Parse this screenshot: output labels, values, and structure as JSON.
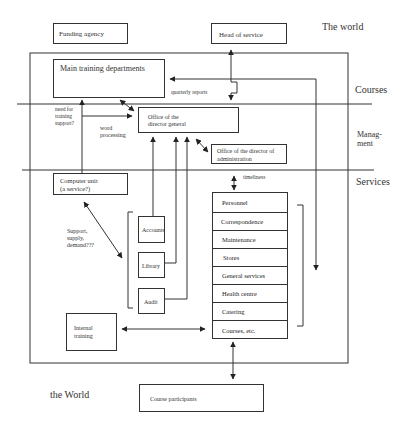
{
  "zones": {
    "the_world_top": "The world",
    "courses": "Courses",
    "management_line1": "Manag-",
    "management_line2": "ment",
    "services": "Services",
    "the_world_bottom": "the World"
  },
  "boxes": {
    "funding_agency": "Funding agency",
    "head_of_service": "Head of service",
    "main_training_departments": "Main training departments",
    "office_director_general_line1": "Office of the",
    "office_director_general_line2": "director general",
    "office_director_administration_line1": "Office of the director of",
    "office_director_administration_line2": "administration",
    "computer_unit_line1": "Computer unit",
    "computer_unit_line2": "(a service?)",
    "accounts": "Accounts",
    "library": "Library",
    "audit": "Audit",
    "internal_training_line1": "Internal",
    "internal_training_line2": "training",
    "course_participants": "Course participants"
  },
  "services_list": [
    "Personnel",
    "Correspondence",
    "Maintenance",
    "Stores",
    "General services",
    "Health centre",
    "Catering",
    "Courses, etc."
  ],
  "labels": {
    "quarterly_reports": "quarterly reports",
    "need_for_line1": "need for",
    "need_for_line2": "training",
    "need_for_line3": "support?",
    "word_line1": "word",
    "word_line2": "processing",
    "timeliness": "timeliness",
    "support_line1": "Support,",
    "support_line2": "supply,",
    "support_line3": "demand???"
  }
}
